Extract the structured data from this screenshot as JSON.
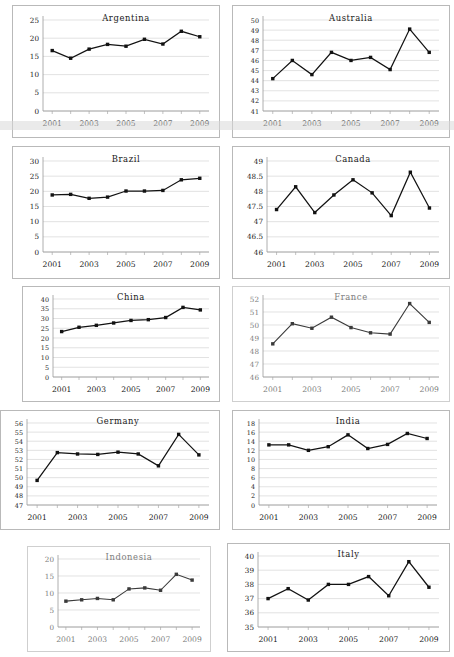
{
  "figure": {
    "layout": "2-column grid of small multiples",
    "panel_count": 10
  },
  "axis": {
    "xtick_labels": [
      "2001",
      "2003",
      "2005",
      "2007",
      "2009"
    ],
    "x_years": [
      2001,
      2002,
      2003,
      2004,
      2005,
      2006,
      2007,
      2008,
      2009
    ],
    "line_color": "#121212",
    "grid_color": "#d6d6d6",
    "border_color": "#b9b9b9"
  },
  "chart_data": [
    {
      "type": "line",
      "title": "Argentina",
      "xlabel": "",
      "ylabel": "",
      "x": [
        2001,
        2002,
        2003,
        2004,
        2005,
        2006,
        2007,
        2008,
        2009
      ],
      "values": [
        16.6,
        14.5,
        17.0,
        18.3,
        17.8,
        19.7,
        18.4,
        21.9,
        20.4
      ],
      "ylim": [
        0,
        25
      ],
      "yticks": [
        0,
        5,
        10,
        15,
        20,
        25
      ],
      "ytick_labels": [
        "0",
        "5",
        "10",
        "15",
        "20",
        "25"
      ],
      "xtick_labels": [
        "2001",
        "2003",
        "2005",
        "2007",
        "2009"
      ],
      "grid": true,
      "legend": "none"
    },
    {
      "type": "line",
      "title": "Australia",
      "xlabel": "",
      "ylabel": "",
      "x": [
        2001,
        2002,
        2003,
        2004,
        2005,
        2006,
        2007,
        2008,
        2009
      ],
      "values": [
        44.2,
        46.0,
        44.6,
        46.8,
        46.0,
        46.3,
        45.1,
        49.1,
        46.8
      ],
      "ylim": [
        41,
        50
      ],
      "yticks": [
        41,
        42,
        43,
        44,
        45,
        46,
        47,
        48,
        49,
        50
      ],
      "ytick_labels": [
        "41",
        "42",
        "43",
        "44",
        "45",
        "46",
        "47",
        "48",
        "49",
        "50"
      ],
      "xtick_labels": [
        "2001",
        "2003",
        "2005",
        "2007",
        "2009"
      ],
      "grid": true,
      "legend": "none"
    },
    {
      "type": "line",
      "title": "Brazil",
      "xlabel": "",
      "ylabel": "",
      "x": [
        2001,
        2002,
        2003,
        2004,
        2005,
        2006,
        2007,
        2008,
        2009
      ],
      "values": [
        18.8,
        19.0,
        17.7,
        18.1,
        20.1,
        20.1,
        20.3,
        23.8,
        24.3
      ],
      "ylim": [
        0,
        30
      ],
      "yticks": [
        0,
        5,
        10,
        15,
        20,
        25,
        30
      ],
      "ytick_labels": [
        "0",
        "5",
        "10",
        "15",
        "20",
        "25",
        "30"
      ],
      "xtick_labels": [
        "2001",
        "2003",
        "2005",
        "2007",
        "2009"
      ],
      "grid": true,
      "legend": "none"
    },
    {
      "type": "line",
      "title": "Canada",
      "xlabel": "",
      "ylabel": "",
      "x": [
        2001,
        2002,
        2003,
        2004,
        2005,
        2006,
        2007,
        2008,
        2009
      ],
      "values": [
        47.4,
        48.15,
        47.3,
        47.88,
        48.38,
        47.95,
        47.2,
        48.63,
        47.45
      ],
      "ylim": [
        46,
        49
      ],
      "yticks": [
        46,
        46.5,
        47,
        47.5,
        48,
        48.5,
        49
      ],
      "ytick_labels": [
        "46",
        "46.5",
        "47",
        "47.5",
        "48",
        "48.5",
        "49"
      ],
      "xtick_labels": [
        "2001",
        "2003",
        "2005",
        "2007",
        "2009"
      ],
      "grid": true,
      "legend": "none"
    },
    {
      "type": "line",
      "title": "China",
      "xlabel": "",
      "ylabel": "",
      "x": [
        2001,
        2002,
        2003,
        2004,
        2005,
        2006,
        2007,
        2008,
        2009
      ],
      "values": [
        23.3,
        25.5,
        26.5,
        27.7,
        29.0,
        29.4,
        30.5,
        35.7,
        34.4
      ],
      "ylim": [
        0,
        40
      ],
      "yticks": [
        0,
        5,
        10,
        15,
        20,
        25,
        30,
        35,
        40
      ],
      "ytick_labels": [
        "0",
        "5",
        "10",
        "15",
        "20",
        "25",
        "30",
        "35",
        "40"
      ],
      "xtick_labels": [
        "2001",
        "2003",
        "2005",
        "2007",
        "2009"
      ],
      "grid": true,
      "legend": "none"
    },
    {
      "type": "line",
      "title": "France",
      "xlabel": "",
      "ylabel": "",
      "x": [
        2001,
        2002,
        2003,
        2004,
        2005,
        2006,
        2007,
        2008,
        2009
      ],
      "values": [
        48.55,
        50.1,
        49.75,
        50.6,
        49.8,
        49.4,
        49.3,
        51.65,
        50.2
      ],
      "ylim": [
        46,
        52
      ],
      "yticks": [
        46,
        47,
        48,
        49,
        50,
        51,
        52
      ],
      "ytick_labels": [
        "46",
        "47",
        "48",
        "49",
        "50",
        "51",
        "52"
      ],
      "xtick_labels": [
        "2001",
        "2003",
        "2005",
        "2007",
        "2009"
      ],
      "grid": true,
      "legend": "none"
    },
    {
      "type": "line",
      "title": "Germany",
      "xlabel": "",
      "ylabel": "",
      "x": [
        2001,
        2002,
        2003,
        2004,
        2005,
        2006,
        2007,
        2008,
        2009
      ],
      "values": [
        49.7,
        52.75,
        52.6,
        52.55,
        52.8,
        52.6,
        51.3,
        54.75,
        52.5
      ],
      "ylim": [
        47,
        56
      ],
      "yticks": [
        47,
        48,
        49,
        50,
        51,
        52,
        53,
        54,
        55,
        56
      ],
      "ytick_labels": [
        "47",
        "48",
        "49",
        "50",
        "51",
        "52",
        "53",
        "54",
        "55",
        "56"
      ],
      "xtick_labels": [
        "2001",
        "2003",
        "2005",
        "2007",
        "2009"
      ],
      "grid": true,
      "legend": "none"
    },
    {
      "type": "line",
      "title": "India",
      "xlabel": "",
      "ylabel": "",
      "x": [
        2001,
        2002,
        2003,
        2004,
        2005,
        2006,
        2007,
        2008,
        2009
      ],
      "values": [
        13.2,
        13.2,
        12.0,
        12.8,
        15.4,
        12.4,
        13.3,
        15.7,
        14.6
      ],
      "ylim": [
        0,
        18
      ],
      "yticks": [
        0,
        2,
        4,
        6,
        8,
        10,
        12,
        14,
        16,
        18
      ],
      "ytick_labels": [
        "0",
        "2",
        "4",
        "6",
        "8",
        "10",
        "12",
        "14",
        "16",
        "18"
      ],
      "xtick_labels": [
        "2001",
        "2003",
        "2005",
        "2007",
        "2009"
      ],
      "grid": true,
      "legend": "none"
    },
    {
      "type": "line",
      "title": "Indonesia",
      "xlabel": "",
      "ylabel": "",
      "x": [
        2001,
        2002,
        2003,
        2004,
        2005,
        2006,
        2007,
        2008,
        2009
      ],
      "values": [
        7.6,
        8.0,
        8.4,
        8.0,
        11.2,
        11.5,
        10.8,
        15.5,
        13.8
      ],
      "ylim": [
        0,
        20
      ],
      "yticks": [
        0,
        5,
        10,
        15,
        20
      ],
      "ytick_labels": [
        "0",
        "5",
        "10",
        "15",
        "20"
      ],
      "xtick_labels": [
        "2001",
        "2003",
        "2005",
        "2007",
        "2009"
      ],
      "grid": true,
      "legend": "none"
    },
    {
      "type": "line",
      "title": "Italy",
      "xlabel": "",
      "ylabel": "",
      "x": [
        2001,
        2002,
        2003,
        2004,
        2005,
        2006,
        2007,
        2008,
        2009
      ],
      "values": [
        37.0,
        37.7,
        36.9,
        38.0,
        38.0,
        38.55,
        37.2,
        39.6,
        37.8
      ],
      "ylim": [
        35,
        40
      ],
      "yticks": [
        35,
        36,
        37,
        38,
        39,
        40
      ],
      "ytick_labels": [
        "35",
        "36",
        "37",
        "38",
        "39",
        "40"
      ],
      "xtick_labels": [
        "2001",
        "2003",
        "2005",
        "2007",
        "2009"
      ],
      "grid": true,
      "legend": "none"
    }
  ]
}
